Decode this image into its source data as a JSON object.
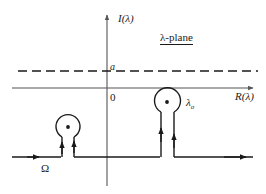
{
  "figure": {
    "plane_label": "λ-plane",
    "axes": {
      "vertical_label": "I(λ)",
      "horizontal_label": "R(λ)",
      "origin_label": "0"
    },
    "dashed_line_label": "a",
    "pole_label_base": "λ",
    "pole_label_subscript": "o",
    "contour_label": "Ω",
    "colors": {
      "ink": "#1a1a1a",
      "axis": "#555555",
      "background": "#ffffff"
    },
    "geometry": {
      "origin_x": 107,
      "origin_y": 88,
      "dashed_line_y": 71,
      "contour_baseline_y": 157,
      "left_loop_center_x": 68,
      "left_loop_center_y": 127,
      "left_loop_radius": 12,
      "right_loop_center_x": 167,
      "right_loop_center_y": 102,
      "right_loop_radius": 13
    }
  }
}
